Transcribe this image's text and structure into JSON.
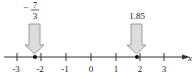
{
  "diagram": {
    "type": "number_line",
    "axis_label": "x",
    "ticks": [
      "-3",
      "-2",
      "-1",
      "0",
      "1",
      "2",
      "3"
    ],
    "points": [
      {
        "value": -2.3333,
        "label_numerator": "7",
        "label_denominator": "3",
        "label_sign": "−"
      },
      {
        "value": 1.85,
        "label": "1.85"
      }
    ]
  }
}
